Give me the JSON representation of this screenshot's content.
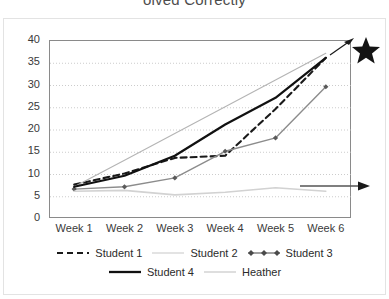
{
  "chart_title": "olved Correctly",
  "axes": {
    "y_ticks": [
      "40",
      "35",
      "30",
      "25",
      "20",
      "15",
      "10",
      "5",
      "0"
    ],
    "x_ticks": [
      "Week 1",
      "Week 2",
      "Week 3",
      "Week 4",
      "Week 5",
      "Week 6"
    ]
  },
  "legend": {
    "row1": [
      {
        "label": "Student 1",
        "style": "dashed-black",
        "color": "#1a1a1a"
      },
      {
        "label": "Student 2",
        "style": "thin-light",
        "color": "#d0d0d0"
      },
      {
        "label": "Student 3",
        "style": "marker-gray",
        "color": "#6e6e6e"
      }
    ],
    "row2": [
      {
        "label": "Student 4",
        "style": "thick-black",
        "color": "#111111"
      },
      {
        "label": "Heather",
        "style": "thin-light",
        "color": "#c8c8c8"
      }
    ]
  },
  "annotations": {
    "star_icon": "star-icon",
    "arrow_top_icon": "arrow-right-icon",
    "arrow_side_icon": "arrow-right-icon"
  },
  "chart_data": {
    "type": "line",
    "title": "olved Correctly",
    "xlabel": "",
    "ylabel": "",
    "ylim": [
      0,
      40
    ],
    "y_tick_step": 5,
    "grid": true,
    "legend_position": "bottom",
    "categories": [
      "Week 1",
      "Week 2",
      "Week 3",
      "Week 4",
      "Week 5",
      "Week 6"
    ],
    "series": [
      {
        "name": "Student 1",
        "values": [
          7.5,
          10,
          13.5,
          14,
          24.5,
          36
        ],
        "color": "#1a1a1a",
        "dash": "6,4",
        "width": 2.1
      },
      {
        "name": "Student 2",
        "values": [
          7,
          13,
          19,
          25,
          31,
          37
        ],
        "color": "#b4b4b4",
        "dash": "none",
        "width": 1.1
      },
      {
        "name": "Student 3",
        "values": [
          6.5,
          7,
          9,
          15,
          18,
          29.5
        ],
        "color": "#8c8c8c",
        "dash": "none",
        "width": 1.4,
        "marker": "diamond"
      },
      {
        "name": "Student 4",
        "values": [
          7,
          9.5,
          14,
          21,
          27,
          36
        ],
        "color": "#111111",
        "dash": "none",
        "width": 2.2
      },
      {
        "name": "Heather",
        "values": [
          6,
          6.2,
          5.2,
          5.8,
          6.8,
          6
        ],
        "color": "#d2d2d2",
        "dash": "none",
        "width": 1.6
      }
    ]
  }
}
